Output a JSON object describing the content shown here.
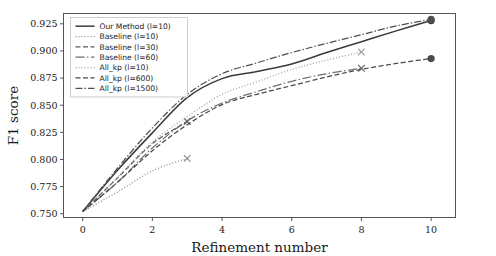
{
  "chart_data": {
    "type": "line",
    "title": "",
    "xlabel": "Refinement number",
    "ylabel": "F1 score",
    "xlim": [
      -0.55,
      10.7
    ],
    "ylim": [
      0.7465,
      0.9345
    ],
    "xticks": [
      0,
      2,
      4,
      6,
      8,
      10
    ],
    "xticklabels": [
      "0",
      "2",
      "4",
      "6",
      "8",
      "10"
    ],
    "yticks": [
      0.75,
      0.775,
      0.8,
      0.825,
      0.85,
      0.875,
      0.9,
      0.925
    ],
    "yticklabels": [
      "0.750",
      "0.775",
      "0.800",
      "0.825",
      "0.850",
      "0.875",
      "0.900",
      "0.925"
    ],
    "grid": false,
    "legend_position": "upper left",
    "background_color": "#ffffff",
    "series": [
      {
        "name": "Our Method (l=10)",
        "linestyle": "solid",
        "color": "#3b3b3b",
        "marker": "circle",
        "marker_at": [
          10
        ],
        "x": [
          0,
          1,
          2,
          3,
          4,
          5,
          6,
          7,
          8,
          9,
          10
        ],
        "y": [
          0.752,
          0.79,
          0.8245,
          0.857,
          0.8745,
          0.881,
          0.888,
          0.8985,
          0.9085,
          0.9185,
          0.928
        ]
      },
      {
        "name": "Baseline (l=10)",
        "linestyle": "dotted",
        "color": "#8a8a8a",
        "marker": "x",
        "marker_at": [
          3
        ],
        "x": [
          0,
          1,
          2,
          3
        ],
        "y": [
          0.752,
          0.77,
          0.7895,
          0.801
        ]
      },
      {
        "name": "Baseline (l=30)",
        "linestyle": "dashed",
        "color": "#5a5a5a",
        "marker": "x",
        "marker_at": [
          3
        ],
        "x": [
          0,
          1,
          2,
          3
        ],
        "y": [
          0.752,
          0.783,
          0.8145,
          0.835
        ]
      },
      {
        "name": "Baseline (l=60)",
        "linestyle": "dashdot-long",
        "color": "#6e6e6e",
        "marker": "x",
        "marker_at": [
          8
        ],
        "x": [
          0,
          1,
          2,
          3,
          4,
          5,
          6,
          7,
          8
        ],
        "y": [
          0.752,
          0.779,
          0.8105,
          0.8355,
          0.852,
          0.8625,
          0.872,
          0.879,
          0.884
        ]
      },
      {
        "name": "All_kp (l=10)",
        "linestyle": "dotted",
        "color": "#a0a0a0",
        "marker": "x",
        "marker_at": [
          8
        ],
        "x": [
          0,
          1,
          2,
          3,
          4,
          5,
          6,
          7,
          8
        ],
        "y": [
          0.752,
          0.7835,
          0.816,
          0.8395,
          0.86,
          0.8715,
          0.883,
          0.8915,
          0.899
        ]
      },
      {
        "name": "All_kp (l=600)",
        "linestyle": "dashed",
        "color": "#4a4a4a",
        "marker": "circle",
        "marker_at": [
          10
        ],
        "x": [
          0,
          1,
          2,
          3,
          4,
          5,
          6,
          7,
          8,
          9,
          10
        ],
        "y": [
          0.752,
          0.779,
          0.808,
          0.832,
          0.8505,
          0.86,
          0.868,
          0.876,
          0.883,
          0.8885,
          0.893
        ]
      },
      {
        "name": "All_kp (l=1500)",
        "linestyle": "dashdot",
        "color": "#4f4f4f",
        "marker": "circle",
        "marker_at": [
          10
        ],
        "x": [
          0,
          1,
          2,
          3,
          4,
          5,
          6,
          7,
          8,
          9,
          10
        ],
        "y": [
          0.752,
          0.792,
          0.829,
          0.86,
          0.879,
          0.889,
          0.8985,
          0.907,
          0.915,
          0.923,
          0.929
        ]
      }
    ]
  }
}
